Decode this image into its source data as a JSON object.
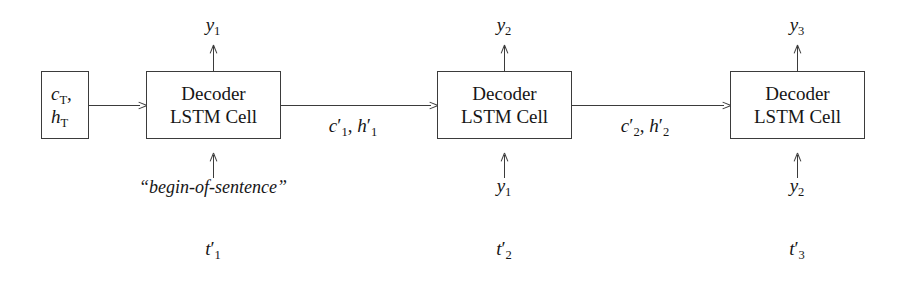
{
  "diagram": {
    "colors": {
      "stroke": "#3b3b3b",
      "text": "#161616",
      "background": "#ffffff"
    },
    "initial_state_box": {
      "line1": "cT,",
      "line1_base": "c",
      "line1_sub": "T",
      "line1_tail": ",",
      "line2_base": "h",
      "line2_sub": "T"
    },
    "cells": [
      {
        "line1": "Decoder",
        "line2": "LSTM Cell"
      },
      {
        "line1": "Decoder",
        "line2": "LSTM Cell"
      },
      {
        "line1": "Decoder",
        "line2": "LSTM Cell"
      }
    ],
    "outputs": [
      {
        "base": "y",
        "sub": "1"
      },
      {
        "base": "y",
        "sub": "2"
      },
      {
        "base": "y",
        "sub": "3"
      }
    ],
    "inputs": [
      {
        "text": "“begin-of-sentence”"
      },
      {
        "base": "y",
        "sub": "1"
      },
      {
        "base": "y",
        "sub": "2"
      }
    ],
    "edge_labels": [
      {
        "c_base": "c",
        "c_prime": "′",
        "c_sub": "1",
        "sep": ", ",
        "h_base": "h",
        "h_prime": "′",
        "h_sub": "1"
      },
      {
        "c_base": "c",
        "c_prime": "′",
        "c_sub": "2",
        "sep": ", ",
        "h_base": "h",
        "h_prime": "′",
        "h_sub": "2"
      }
    ],
    "timesteps": [
      {
        "base": "t",
        "prime": "′",
        "sub": "1"
      },
      {
        "base": "t",
        "prime": "′",
        "sub": "2"
      },
      {
        "base": "t",
        "prime": "′",
        "sub": "3"
      }
    ]
  }
}
